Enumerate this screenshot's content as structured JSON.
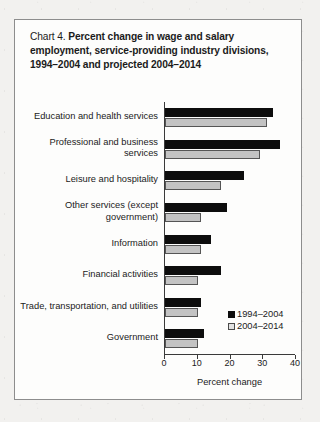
{
  "chart_box": {
    "title_lead": "Chart 4.",
    "title_main": "Percent change in wage and salary employment, service-providing industry divisions, 1994–2004 and projected 2004–2014"
  },
  "chart_data": {
    "type": "bar",
    "orientation": "horizontal",
    "title": "Chart 4.  Percent change in wage and salary employment, service-providing industry divisions, 1994–2004 and projected 2004–2014",
    "xlabel": "Percent change",
    "ylabel": "",
    "xlim": [
      0,
      40
    ],
    "xticks": [
      0,
      10,
      20,
      30,
      40
    ],
    "xtick_labels": [
      "0",
      "10",
      "20",
      "30",
      "40"
    ],
    "grid": false,
    "legend_position": "lower-right-inside",
    "categories": [
      "Education and health services",
      "Professional and business\nservices",
      "Leisure and hospitality",
      "Other services (except\ngovernment)",
      "Information",
      "Financial activities",
      "Trade, transportation, and utilities",
      "Government"
    ],
    "series": [
      {
        "name": "1994–2004",
        "color": "#0d0d0d",
        "values": [
          33,
          35,
          24,
          19,
          14,
          17,
          11,
          12
        ]
      },
      {
        "name": "2004–2014",
        "color": "#c3c3c3",
        "values": [
          31,
          29,
          17,
          11,
          11,
          10,
          10,
          10
        ]
      }
    ]
  },
  "legend": {
    "items": [
      {
        "label": "1994–2004"
      },
      {
        "label": "2004–2014"
      }
    ]
  }
}
